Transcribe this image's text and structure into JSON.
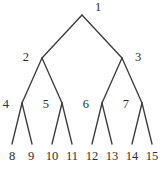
{
  "figure": {
    "kind": "binary-tree-diagram",
    "width": 165,
    "height": 170,
    "background_color": "#ffffff",
    "line_color": "#3b3b3b",
    "text_color": "#2e2e2e"
  },
  "nodes": [
    {
      "label": "1",
      "x": 82,
      "y": 15,
      "label_x": 95,
      "label_y": 8,
      "level": 0,
      "anchor": "start"
    },
    {
      "label": "2",
      "x": 42,
      "y": 58,
      "label_x": 29,
      "label_y": 58,
      "level": 1,
      "anchor": "end"
    },
    {
      "label": "3",
      "x": 122,
      "y": 58,
      "label_x": 135,
      "label_y": 58,
      "level": 1,
      "anchor": "start"
    },
    {
      "label": "4",
      "x": 22,
      "y": 103,
      "label_x": 9,
      "label_y": 105,
      "level": 2,
      "anchor": "end"
    },
    {
      "label": "5",
      "x": 62,
      "y": 103,
      "label_x": 49,
      "label_y": 105,
      "level": 2,
      "anchor": "end"
    },
    {
      "label": "6",
      "x": 102,
      "y": 103,
      "label_x": 89,
      "label_y": 105,
      "level": 2,
      "anchor": "end"
    },
    {
      "label": "7",
      "x": 142,
      "y": 103,
      "label_x": 129,
      "label_y": 105,
      "level": 2,
      "anchor": "end"
    },
    {
      "label": "8",
      "x": 12,
      "y": 146,
      "label_x": 12,
      "label_y": 157,
      "level": 3,
      "anchor": "middle"
    },
    {
      "label": "9",
      "x": 31,
      "y": 146,
      "label_x": 31,
      "label_y": 157,
      "level": 3,
      "anchor": "middle"
    },
    {
      "label": "10",
      "x": 52,
      "y": 146,
      "label_x": 52,
      "label_y": 157,
      "level": 3,
      "anchor": "middle"
    },
    {
      "label": "11",
      "x": 72,
      "y": 146,
      "label_x": 72,
      "label_y": 157,
      "level": 3,
      "anchor": "middle"
    },
    {
      "label": "12",
      "x": 92,
      "y": 146,
      "label_x": 92,
      "label_y": 157,
      "level": 3,
      "anchor": "middle"
    },
    {
      "label": "13",
      "x": 112,
      "y": 146,
      "label_x": 112,
      "label_y": 157,
      "level": 3,
      "anchor": "middle"
    },
    {
      "label": "14",
      "x": 132,
      "y": 146,
      "label_x": 132,
      "label_y": 157,
      "level": 3,
      "anchor": "middle"
    },
    {
      "label": "15",
      "x": 152,
      "y": 146,
      "label_x": 152,
      "label_y": 157,
      "level": 3,
      "anchor": "middle"
    }
  ],
  "edges": [
    {
      "from": "1",
      "to": "2",
      "x1": 82,
      "y1": 15,
      "x2": 42,
      "y2": 58
    },
    {
      "from": "1",
      "to": "3",
      "x1": 82,
      "y1": 15,
      "x2": 122,
      "y2": 58
    },
    {
      "from": "2",
      "to": "4",
      "x1": 42,
      "y1": 58,
      "x2": 22,
      "y2": 103
    },
    {
      "from": "2",
      "to": "5",
      "x1": 42,
      "y1": 58,
      "x2": 62,
      "y2": 103
    },
    {
      "from": "3",
      "to": "6",
      "x1": 122,
      "y1": 58,
      "x2": 102,
      "y2": 103
    },
    {
      "from": "3",
      "to": "7",
      "x1": 122,
      "y1": 58,
      "x2": 142,
      "y2": 103
    },
    {
      "from": "4",
      "to": "8",
      "x1": 22,
      "y1": 103,
      "x2": 12,
      "y2": 144
    },
    {
      "from": "4",
      "to": "9",
      "x1": 22,
      "y1": 103,
      "x2": 32,
      "y2": 144
    },
    {
      "from": "5",
      "to": "10",
      "x1": 62,
      "y1": 103,
      "x2": 52,
      "y2": 144
    },
    {
      "from": "5",
      "to": "11",
      "x1": 62,
      "y1": 103,
      "x2": 72,
      "y2": 144
    },
    {
      "from": "6",
      "to": "12",
      "x1": 102,
      "y1": 103,
      "x2": 92,
      "y2": 144
    },
    {
      "from": "6",
      "to": "13",
      "x1": 102,
      "y1": 103,
      "x2": 112,
      "y2": 144
    },
    {
      "from": "7",
      "to": "14",
      "x1": 142,
      "y1": 103,
      "x2": 132,
      "y2": 144
    },
    {
      "from": "7",
      "to": "15",
      "x1": 142,
      "y1": 103,
      "x2": 152,
      "y2": 144
    }
  ]
}
